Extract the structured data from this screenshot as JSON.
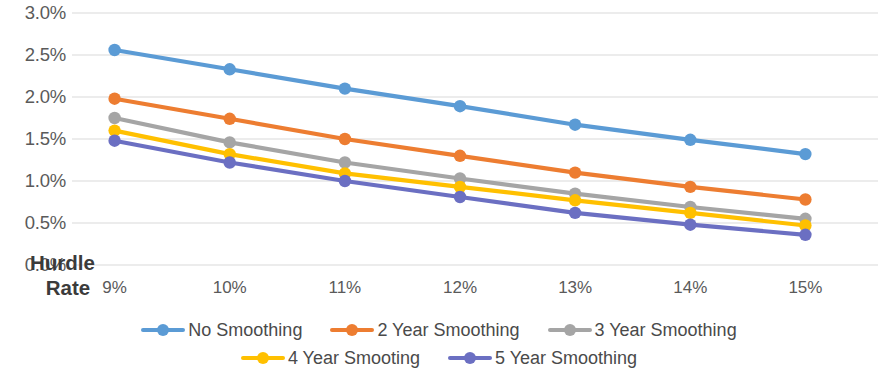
{
  "chart_data": {
    "type": "line",
    "title": "",
    "xlabel": "Hurdle Rate",
    "ylabel": "",
    "categories": [
      "9%",
      "10%",
      "11%",
      "12%",
      "13%",
      "14%",
      "15%"
    ],
    "x_tick_labels": [
      "9%",
      "10%",
      "11%",
      "12%",
      "13%",
      "14%",
      "15%"
    ],
    "y_tick_labels": [
      "3.0%",
      "2.5%",
      "2.0%",
      "1.5%",
      "1.0%",
      "0.5%",
      "0.0%"
    ],
    "y_tick_values": [
      3.0,
      2.5,
      2.0,
      1.5,
      1.0,
      0.5,
      0.0
    ],
    "ylim": [
      0.0,
      3.0
    ],
    "grid": true,
    "grid_axis": "y",
    "legend_position": "bottom",
    "markers": true,
    "series": [
      {
        "name": "No Smoothing",
        "color": "#5B9BD5",
        "values": [
          2.56,
          2.33,
          2.1,
          1.89,
          1.67,
          1.49,
          1.32
        ]
      },
      {
        "name": "2 Year Smoothing",
        "color": "#ED7D31",
        "values": [
          1.98,
          1.74,
          1.5,
          1.3,
          1.1,
          0.93,
          0.78
        ]
      },
      {
        "name": "3 Year Smoothing",
        "color": "#A5A5A5",
        "values": [
          1.75,
          1.46,
          1.22,
          1.03,
          0.85,
          0.69,
          0.55
        ]
      },
      {
        "name": "4 Year Smooting",
        "color": "#FFC000",
        "values": [
          1.6,
          1.32,
          1.09,
          0.93,
          0.77,
          0.62,
          0.47
        ]
      },
      {
        "name": "5 Year Smoothing",
        "color": "#6B6FC2",
        "values": [
          1.48,
          1.22,
          1.0,
          0.81,
          0.62,
          0.48,
          0.36
        ]
      }
    ]
  },
  "axis_title": {
    "line1": "Hurdle",
    "line2": "Rate"
  },
  "colors": {
    "grid": "#D9D9D9",
    "tick_text": "#5A5A5A",
    "legend_text": "#4A4A4A",
    "axis_title_text": "#3B3B3B",
    "background": "#FFFFFF"
  }
}
